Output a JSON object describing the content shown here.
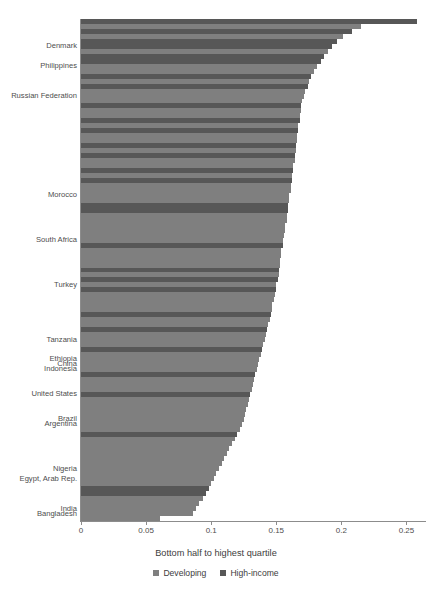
{
  "chart_data": {
    "type": "bar",
    "orientation": "horizontal",
    "title": "",
    "xlabel": "Bottom half to highest quartile",
    "ylabel": "",
    "xlim": [
      0,
      0.265
    ],
    "xticks": [
      0,
      0.05,
      0.1,
      0.15,
      0.2,
      0.25
    ],
    "xticklabels": [
      "0",
      "0.05",
      "0.1",
      "0.15",
      "0.2",
      "0.25"
    ],
    "grid": false,
    "legend_position": "bottom",
    "series": [
      {
        "name": "Developing",
        "color": "#7f7f7f"
      },
      {
        "name": "High-income",
        "color": "#575757"
      }
    ],
    "labeled_categories": [
      "Denmark",
      "Philippines",
      "Russian Federation",
      "Morocco",
      "South Africa",
      "Turkey",
      "Tanzania",
      "Ethiopia",
      "China",
      "Indonesia",
      "United States",
      "Brazil",
      "Argentina",
      "Nigeria",
      "Egypt, Arab Rep.",
      "India",
      "Bangladesh"
    ],
    "bars": [
      {
        "label": "",
        "value": 0.258,
        "group": "High-income"
      },
      {
        "label": "",
        "value": 0.215,
        "group": "Developing"
      },
      {
        "label": "",
        "value": 0.208,
        "group": "High-income"
      },
      {
        "label": "",
        "value": 0.201,
        "group": "Developing"
      },
      {
        "label": "",
        "value": 0.197,
        "group": "High-income"
      },
      {
        "label": "Denmark",
        "value": 0.193,
        "group": "High-income"
      },
      {
        "label": "",
        "value": 0.19,
        "group": "Developing"
      },
      {
        "label": "",
        "value": 0.187,
        "group": "High-income"
      },
      {
        "label": "",
        "value": 0.184,
        "group": "High-income"
      },
      {
        "label": "Philippines",
        "value": 0.181,
        "group": "Developing"
      },
      {
        "label": "",
        "value": 0.179,
        "group": "Developing"
      },
      {
        "label": "",
        "value": 0.177,
        "group": "High-income"
      },
      {
        "label": "",
        "value": 0.175,
        "group": "Developing"
      },
      {
        "label": "",
        "value": 0.174,
        "group": "High-income"
      },
      {
        "label": "",
        "value": 0.172,
        "group": "Developing"
      },
      {
        "label": "Russian Federation",
        "value": 0.171,
        "group": "Developing"
      },
      {
        "label": "",
        "value": 0.17,
        "group": "Developing"
      },
      {
        "label": "",
        "value": 0.169,
        "group": "High-income"
      },
      {
        "label": "",
        "value": 0.169,
        "group": "Developing"
      },
      {
        "label": "",
        "value": 0.168,
        "group": "Developing"
      },
      {
        "label": "",
        "value": 0.168,
        "group": "High-income"
      },
      {
        "label": "",
        "value": 0.167,
        "group": "Developing"
      },
      {
        "label": "",
        "value": 0.167,
        "group": "High-income"
      },
      {
        "label": "",
        "value": 0.166,
        "group": "Developing"
      },
      {
        "label": "",
        "value": 0.166,
        "group": "Developing"
      },
      {
        "label": "",
        "value": 0.165,
        "group": "High-income"
      },
      {
        "label": "",
        "value": 0.165,
        "group": "Developing"
      },
      {
        "label": "",
        "value": 0.164,
        "group": "High-income"
      },
      {
        "label": "",
        "value": 0.164,
        "group": "Developing"
      },
      {
        "label": "",
        "value": 0.163,
        "group": "Developing"
      },
      {
        "label": "",
        "value": 0.163,
        "group": "High-income"
      },
      {
        "label": "",
        "value": 0.162,
        "group": "Developing"
      },
      {
        "label": "",
        "value": 0.162,
        "group": "High-income"
      },
      {
        "label": "",
        "value": 0.161,
        "group": "Developing"
      },
      {
        "label": "",
        "value": 0.161,
        "group": "Developing"
      },
      {
        "label": "Morocco",
        "value": 0.16,
        "group": "Developing"
      },
      {
        "label": "",
        "value": 0.16,
        "group": "Developing"
      },
      {
        "label": "",
        "value": 0.159,
        "group": "High-income"
      },
      {
        "label": "",
        "value": 0.159,
        "group": "High-income"
      },
      {
        "label": "",
        "value": 0.158,
        "group": "Developing"
      },
      {
        "label": "",
        "value": 0.158,
        "group": "Developing"
      },
      {
        "label": "",
        "value": 0.157,
        "group": "Developing"
      },
      {
        "label": "",
        "value": 0.157,
        "group": "Developing"
      },
      {
        "label": "",
        "value": 0.156,
        "group": "Developing"
      },
      {
        "label": "South Africa",
        "value": 0.155,
        "group": "Developing"
      },
      {
        "label": "",
        "value": 0.155,
        "group": "High-income"
      },
      {
        "label": "",
        "value": 0.154,
        "group": "Developing"
      },
      {
        "label": "",
        "value": 0.154,
        "group": "Developing"
      },
      {
        "label": "",
        "value": 0.153,
        "group": "Developing"
      },
      {
        "label": "",
        "value": 0.153,
        "group": "Developing"
      },
      {
        "label": "",
        "value": 0.152,
        "group": "High-income"
      },
      {
        "label": "",
        "value": 0.152,
        "group": "Developing"
      },
      {
        "label": "",
        "value": 0.151,
        "group": "High-income"
      },
      {
        "label": "Turkey",
        "value": 0.15,
        "group": "Developing"
      },
      {
        "label": "",
        "value": 0.15,
        "group": "High-income"
      },
      {
        "label": "",
        "value": 0.149,
        "group": "Developing"
      },
      {
        "label": "",
        "value": 0.148,
        "group": "Developing"
      },
      {
        "label": "",
        "value": 0.147,
        "group": "Developing"
      },
      {
        "label": "",
        "value": 0.147,
        "group": "Developing"
      },
      {
        "label": "",
        "value": 0.146,
        "group": "High-income"
      },
      {
        "label": "",
        "value": 0.145,
        "group": "Developing"
      },
      {
        "label": "",
        "value": 0.144,
        "group": "Developing"
      },
      {
        "label": "",
        "value": 0.143,
        "group": "High-income"
      },
      {
        "label": "",
        "value": 0.142,
        "group": "Developing"
      },
      {
        "label": "Tanzania",
        "value": 0.141,
        "group": "Developing"
      },
      {
        "label": "",
        "value": 0.14,
        "group": "Developing"
      },
      {
        "label": "",
        "value": 0.139,
        "group": "High-income"
      },
      {
        "label": "",
        "value": 0.138,
        "group": "Developing"
      },
      {
        "label": "Ethiopia",
        "value": 0.137,
        "group": "Developing"
      },
      {
        "label": "China",
        "value": 0.136,
        "group": "Developing"
      },
      {
        "label": "Indonesia",
        "value": 0.135,
        "group": "Developing"
      },
      {
        "label": "",
        "value": 0.134,
        "group": "High-income"
      },
      {
        "label": "",
        "value": 0.133,
        "group": "Developing"
      },
      {
        "label": "",
        "value": 0.132,
        "group": "Developing"
      },
      {
        "label": "",
        "value": 0.131,
        "group": "Developing"
      },
      {
        "label": "United States",
        "value": 0.13,
        "group": "High-income"
      },
      {
        "label": "",
        "value": 0.129,
        "group": "Developing"
      },
      {
        "label": "",
        "value": 0.128,
        "group": "Developing"
      },
      {
        "label": "",
        "value": 0.127,
        "group": "Developing"
      },
      {
        "label": "",
        "value": 0.126,
        "group": "Developing"
      },
      {
        "label": "Brazil",
        "value": 0.125,
        "group": "Developing"
      },
      {
        "label": "Argentina",
        "value": 0.124,
        "group": "Developing"
      },
      {
        "label": "",
        "value": 0.122,
        "group": "Developing"
      },
      {
        "label": "",
        "value": 0.12,
        "group": "High-income"
      },
      {
        "label": "",
        "value": 0.118,
        "group": "Developing"
      },
      {
        "label": "",
        "value": 0.116,
        "group": "Developing"
      },
      {
        "label": "",
        "value": 0.114,
        "group": "Developing"
      },
      {
        "label": "",
        "value": 0.112,
        "group": "Developing"
      },
      {
        "label": "",
        "value": 0.11,
        "group": "Developing"
      },
      {
        "label": "",
        "value": 0.108,
        "group": "Developing"
      },
      {
        "label": "Nigeria",
        "value": 0.106,
        "group": "Developing"
      },
      {
        "label": "",
        "value": 0.104,
        "group": "Developing"
      },
      {
        "label": "Egypt, Arab Rep.",
        "value": 0.102,
        "group": "Developing"
      },
      {
        "label": "",
        "value": 0.1,
        "group": "Developing"
      },
      {
        "label": "",
        "value": 0.098,
        "group": "High-income"
      },
      {
        "label": "",
        "value": 0.096,
        "group": "High-income"
      },
      {
        "label": "",
        "value": 0.094,
        "group": "Developing"
      },
      {
        "label": "",
        "value": 0.091,
        "group": "Developing"
      },
      {
        "label": "India",
        "value": 0.088,
        "group": "Developing"
      },
      {
        "label": "Bangladesh",
        "value": 0.086,
        "group": "Developing"
      },
      {
        "label": "",
        "value": 0.061,
        "group": "Developing"
      }
    ]
  }
}
